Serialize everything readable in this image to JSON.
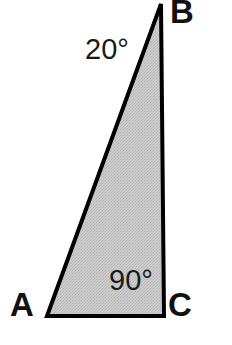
{
  "figure": {
    "kind": "right-triangle-diagram",
    "canvas": {
      "width": 232,
      "height": 345,
      "background": "#ffffff"
    },
    "shape": {
      "name": "triangle-ABC",
      "fill": "#c9c9c9",
      "stroke": "#000000",
      "stroke_width": 4,
      "texture": "dither-halftone"
    },
    "vertices": [
      {
        "id": "A",
        "label": "A",
        "x": 47,
        "y": 316,
        "label_x": 10,
        "label_y": 288
      },
      {
        "id": "B",
        "label": "B",
        "x": 161,
        "y": 4,
        "label_x": 170,
        "label_y": -5
      },
      {
        "id": "C",
        "label": "C",
        "x": 164,
        "y": 316,
        "label_x": 168,
        "label_y": 288
      }
    ],
    "angles": [
      {
        "at_vertex": "B",
        "label": "20°",
        "value": 20,
        "label_x": 85,
        "label_y": 35
      },
      {
        "at_vertex": "C",
        "label": "90°",
        "value": 90,
        "label_x": 109,
        "label_y": 266
      }
    ],
    "sides": [
      {
        "from": "A",
        "to": "B",
        "role": "hypotenuse"
      },
      {
        "from": "B",
        "to": "C",
        "role": "leg-vertical"
      },
      {
        "from": "C",
        "to": "A",
        "role": "leg-base"
      }
    ]
  }
}
